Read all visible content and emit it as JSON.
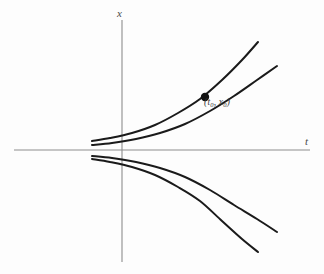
{
  "figure": {
    "background_color": "#fdfdfd",
    "width": 324,
    "height": 274
  },
  "axes": {
    "vertical_label": "x",
    "horizontal_label": "t",
    "axis_color": "#8d8d8d",
    "origin": {
      "x": 122,
      "y": 150
    },
    "vertical_extent": {
      "top": 20,
      "bottom": 262
    },
    "horizontal_extent": {
      "left": 14,
      "right": 310
    }
  },
  "annotations": {
    "point_label_open": "(",
    "point_label_t": "t",
    "point_label_t_sub": "0",
    "point_label_comma": ", ",
    "point_label_x": "x",
    "point_label_x_sub": "0",
    "point_label_close": ")",
    "point_label_plain": "(t0, x0)",
    "marker_color": "#111111"
  },
  "chart_data": {
    "type": "line",
    "xlabel": "t",
    "ylabel": "x",
    "grid": false,
    "legend": "none",
    "curve_color": "#1a1a1a",
    "xlim": [
      14,
      310
    ],
    "ylim": [
      262,
      20
    ],
    "marked_point": {
      "label": "(t0, x0)",
      "px": 205,
      "py": 97
    },
    "series": [
      {
        "name": "upper-outer",
        "path_points": [
          [
            92,
            141
          ],
          [
            110,
            138
          ],
          [
            132,
            133
          ],
          [
            155,
            125
          ],
          [
            178,
            113
          ],
          [
            200,
            99
          ],
          [
            222,
            80
          ],
          [
            242,
            60
          ],
          [
            258,
            42
          ]
        ]
      },
      {
        "name": "upper-inner",
        "path_points": [
          [
            92,
            145
          ],
          [
            112,
            143
          ],
          [
            136,
            139
          ],
          [
            160,
            133
          ],
          [
            185,
            124
          ],
          [
            210,
            111
          ],
          [
            234,
            96
          ],
          [
            257,
            80
          ],
          [
            277,
            66
          ]
        ]
      },
      {
        "name": "lower-inner",
        "path_points": [
          [
            92,
            156
          ],
          [
            112,
            158
          ],
          [
            136,
            162
          ],
          [
            160,
            168
          ],
          [
            185,
            177
          ],
          [
            210,
            190
          ],
          [
            234,
            205
          ],
          [
            257,
            219
          ],
          [
            277,
            232
          ]
        ]
      },
      {
        "name": "lower-outer",
        "path_points": [
          [
            92,
            159
          ],
          [
            110,
            162
          ],
          [
            132,
            167
          ],
          [
            155,
            175
          ],
          [
            178,
            187
          ],
          [
            200,
            201
          ],
          [
            222,
            221
          ],
          [
            242,
            239
          ],
          [
            258,
            252
          ]
        ]
      }
    ]
  }
}
